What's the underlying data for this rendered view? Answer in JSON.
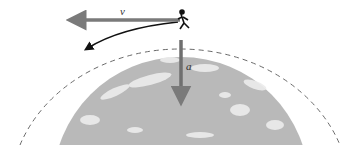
{
  "diagram": {
    "labels": {
      "velocity": "v",
      "acceleration": "a"
    },
    "colors": {
      "arrow": "#7a7a7a",
      "earth": "#b9b9b9",
      "clouds": "#ececec",
      "orbit": "#6a6a6a",
      "path": "#111111"
    }
  }
}
